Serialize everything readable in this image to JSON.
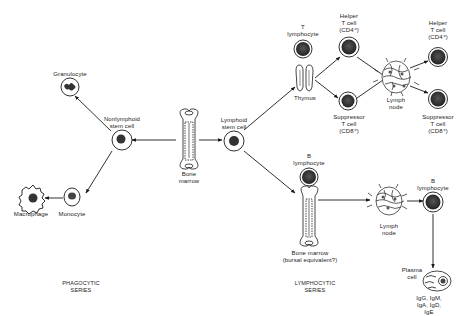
{
  "diagram": {
    "nodes": {
      "bone_marrow": {
        "label": "Bone\nmarrow"
      },
      "nonlymphoid_stem_cell": {
        "label": "Nonlymphoid\nstem cell"
      },
      "granulocyte": {
        "label": "Granulocyte"
      },
      "monocyte": {
        "label": "Monocyte"
      },
      "macrophage": {
        "label": "Macrophage"
      },
      "lymphoid_stem_cell": {
        "label": "Lymphoid\nstem cell"
      },
      "t_lymphocyte": {
        "label": "T\nlymphocyte"
      },
      "thymus": {
        "label": "Thymus"
      },
      "helper_t_cell_1": {
        "label": "Helper\nT cell\n(CD4⁺)"
      },
      "suppressor_t_cell_1": {
        "label": "Suppressor\nT cell\n(CD8⁺)"
      },
      "lymph_node_t": {
        "label": "Lymph\nnode"
      },
      "helper_t_cell_2": {
        "label": "Helper\nT cell\n(CD4⁺)"
      },
      "suppressor_t_cell_2": {
        "label": "Suppressor\nT cell\n(CD8⁺)"
      },
      "b_lymphocyte_1": {
        "label": "B\nlymphocyte"
      },
      "bone_marrow_bursal": {
        "label": "Bone marrow\n(bursal equivalent?)"
      },
      "lymph_node_b": {
        "label": "Lymph\nnode"
      },
      "b_lymphocyte_2": {
        "label": "B\nlymphocyte"
      },
      "plasma_cell": {
        "label": "Plasma\ncell"
      },
      "immunoglobulins": {
        "label": "IgG, IgM, IgA, IgD, IgE"
      }
    },
    "series": {
      "phagocytic": "PHAGOCYTIC\nSERIES",
      "lymphocytic": "LYMPHOCYTIC\nSERIES"
    },
    "edges": [
      {
        "from": "bone_marrow",
        "to": "nonlymphoid_stem_cell"
      },
      {
        "from": "bone_marrow",
        "to": "lymphoid_stem_cell"
      },
      {
        "from": "nonlymphoid_stem_cell",
        "to": "granulocyte"
      },
      {
        "from": "nonlymphoid_stem_cell",
        "to": "monocyte"
      },
      {
        "from": "monocyte",
        "to": "macrophage"
      },
      {
        "from": "lymphoid_stem_cell",
        "to": "thymus"
      },
      {
        "from": "lymphoid_stem_cell",
        "to": "bone_marrow_bursal"
      },
      {
        "from": "thymus",
        "to": "helper_t_cell_1"
      },
      {
        "from": "thymus",
        "to": "suppressor_t_cell_1"
      },
      {
        "from": "helper_t_cell_1",
        "to": "lymph_node_t"
      },
      {
        "from": "suppressor_t_cell_1",
        "to": "lymph_node_t"
      },
      {
        "from": "lymph_node_t",
        "to": "helper_t_cell_2"
      },
      {
        "from": "lymph_node_t",
        "to": "suppressor_t_cell_2"
      },
      {
        "from": "bone_marrow_bursal",
        "to": "lymph_node_b"
      },
      {
        "from": "lymph_node_b",
        "to": "b_lymphocyte_2"
      },
      {
        "from": "b_lymphocyte_2",
        "to": "plasma_cell"
      }
    ],
    "colors": {
      "ink": "#1a1a1a",
      "background": "#ffffff"
    }
  }
}
